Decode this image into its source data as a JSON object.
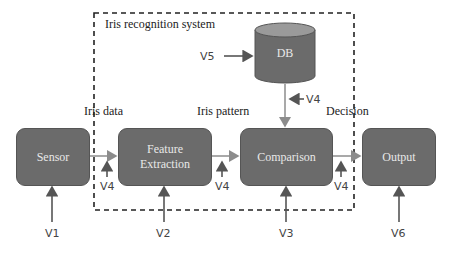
{
  "system": {
    "title": "Iris recognition system"
  },
  "nodes": {
    "sensor": "Sensor",
    "feature_line1": "Feature",
    "feature_line2": "Extraction",
    "comparison": "Comparison",
    "output": "Output",
    "db": "DB"
  },
  "edge_labels": {
    "iris_data": "Iris data",
    "iris_pattern": "Iris pattern",
    "decision": "Decision"
  },
  "vulnerabilities": {
    "v1": "V1",
    "v2": "V2",
    "v3": "V3",
    "v4_a": "V4",
    "v4_b": "V4",
    "v4_c": "V4",
    "v4_db": "V4",
    "v5": "V5",
    "v6": "V6"
  },
  "colors": {
    "box_fill": "#6b6b6b",
    "box_text": "#e8e8e8",
    "arrow": "#555555",
    "flow_arrow": "#8c8c8c"
  }
}
